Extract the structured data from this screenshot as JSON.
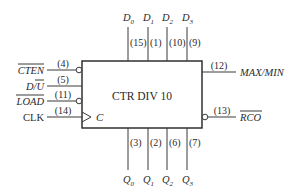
{
  "block": {
    "title": "CTR DIV 10",
    "clock_label": "C"
  },
  "inputs": [
    {
      "name": "CTEN",
      "pin": "(4)",
      "active_low": true
    },
    {
      "name": "D/U",
      "pin": "(5)",
      "active_low": false,
      "overbar_part": "U"
    },
    {
      "name": "LOAD",
      "pin": "(11)",
      "active_low": true
    },
    {
      "name": "CLK",
      "pin": "(14)",
      "active_low": false,
      "clock": true
    }
  ],
  "data_inputs": [
    {
      "name": "D",
      "sub": "0",
      "pin": "(15)"
    },
    {
      "name": "D",
      "sub": "1",
      "pin": "(1)"
    },
    {
      "name": "D",
      "sub": "2",
      "pin": "(10)"
    },
    {
      "name": "D",
      "sub": "3",
      "pin": "(9)"
    }
  ],
  "outputs_bottom": [
    {
      "name": "Q",
      "sub": "0",
      "pin": "(3)"
    },
    {
      "name": "Q",
      "sub": "1",
      "pin": "(2)"
    },
    {
      "name": "Q",
      "sub": "2",
      "pin": "(6)"
    },
    {
      "name": "Q",
      "sub": "3",
      "pin": "(7)"
    }
  ],
  "outputs_right": [
    {
      "name": "MAX/MIN",
      "pin": "(12)",
      "active_low": false
    },
    {
      "name": "RCO",
      "pin": "(13)",
      "active_low": true
    }
  ],
  "colors": {
    "line": "#3a3a3a",
    "text": "#2a2a2a",
    "background": "#ffffff"
  }
}
